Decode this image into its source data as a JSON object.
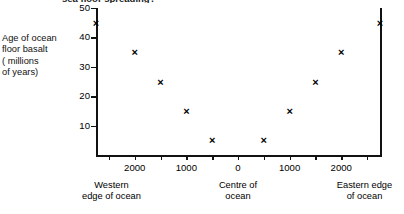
{
  "title_clipped": "sea floor spreading?",
  "axis": {
    "ylabel_lines": [
      "Age of ocean",
      "floor basalt",
      "( millions",
      "of years)"
    ],
    "yticks": [
      10,
      20,
      30,
      40,
      50
    ],
    "xticks": [
      {
        "label": "2000",
        "value": -2000
      },
      {
        "label": "1000",
        "value": -1000
      },
      {
        "label": "0",
        "value": 0
      },
      {
        "label": "1000",
        "value": 1000
      },
      {
        "label": "2000",
        "value": 2000
      }
    ],
    "xcaptions": [
      {
        "lines": [
          "Western",
          "edge of ocean"
        ],
        "value": -2450
      },
      {
        "lines": [
          "Centre of",
          "ocean"
        ],
        "value": 0
      },
      {
        "lines": [
          "Eastern edge",
          "of ocean"
        ],
        "value": 2450
      }
    ]
  },
  "chart_data": {
    "type": "scatter",
    "title": "sea floor spreading?",
    "xlabel": "",
    "ylabel": "Age of ocean floor basalt ( millions of years)",
    "xlim": [
      -2750,
      2750
    ],
    "ylim": [
      0,
      50
    ],
    "grid": false,
    "legend": null,
    "marker": "x",
    "xtick_labels": [
      "2000",
      "1000",
      "0",
      "1000",
      "2000"
    ],
    "xtick_values": [
      -2000,
      -1000,
      0,
      1000,
      2000
    ],
    "ytick_values": [
      10,
      20,
      30,
      40,
      50
    ],
    "x": [
      -2750,
      -2000,
      -1500,
      -1000,
      -500,
      500,
      1000,
      1500,
      2000,
      2750
    ],
    "y": [
      45,
      35,
      25,
      15,
      5,
      5,
      15,
      25,
      35,
      45
    ],
    "points": [
      {
        "x": -2750,
        "y": 45
      },
      {
        "x": -2000,
        "y": 35
      },
      {
        "x": -1500,
        "y": 25
      },
      {
        "x": -1000,
        "y": 15
      },
      {
        "x": -500,
        "y": 5
      },
      {
        "x": 500,
        "y": 5
      },
      {
        "x": 1000,
        "y": 15
      },
      {
        "x": 1500,
        "y": 25
      },
      {
        "x": 2000,
        "y": 35
      },
      {
        "x": 2750,
        "y": 45
      }
    ],
    "annotations": [
      "Western edge of ocean",
      "Centre of ocean",
      "Eastern edge of ocean"
    ]
  }
}
